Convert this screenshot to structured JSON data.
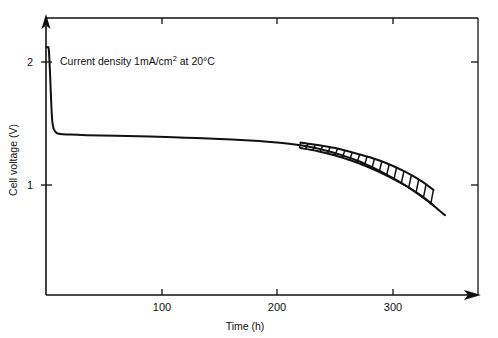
{
  "chart_data": {
    "type": "line",
    "title": "",
    "xlabel": "Time (h)",
    "ylabel": "Cell voltage (V)",
    "xlim": [
      0,
      360
    ],
    "ylim": [
      0,
      2.4
    ],
    "xticks": [
      100,
      200,
      300
    ],
    "xticklabels": [
      "100",
      "200",
      "300"
    ],
    "yticks": [
      1,
      2
    ],
    "yticklabels": [
      "1",
      "2"
    ],
    "grid": false,
    "legend": "none",
    "annotations": [
      {
        "name": "current-density-note",
        "text_prefix": "Current density 1mA/cm",
        "text_superscript": "2",
        "text_suffix": " at 20°C",
        "full_text": "Current density 1mA/cm2 at 20°C",
        "x": 20,
        "y": 2.05
      }
    ],
    "series": [
      {
        "name": "cell-voltage-discharge",
        "label": "Cell voltage",
        "x": [
          0,
          1,
          2,
          3,
          5,
          8,
          12,
          20,
          35,
          60,
          90,
          120,
          150,
          180,
          200,
          215,
          225,
          240,
          255,
          270,
          285,
          300,
          315,
          330,
          345
        ],
        "y": [
          2.12,
          2.12,
          2.1,
          1.92,
          1.52,
          1.43,
          1.415,
          1.41,
          1.405,
          1.4,
          1.395,
          1.385,
          1.375,
          1.36,
          1.345,
          1.33,
          1.315,
          1.285,
          1.245,
          1.195,
          1.13,
          1.055,
          0.97,
          0.87,
          0.755
        ]
      }
    ],
    "uncertainty_band": {
      "name": "tolerance-band",
      "style": "hatched",
      "x_start": 220,
      "x_end": 320,
      "upper_x": [
        220,
        235,
        250,
        265,
        280,
        295,
        310,
        325,
        335
      ],
      "upper_y": [
        1.345,
        1.325,
        1.3,
        1.265,
        1.225,
        1.175,
        1.11,
        1.03,
        0.96
      ],
      "lower_x": [
        220,
        235,
        250,
        265,
        280,
        295,
        310,
        325,
        335
      ],
      "lower_y": [
        1.3,
        1.275,
        1.24,
        1.195,
        1.14,
        1.075,
        1.0,
        0.91,
        0.835
      ],
      "hatch_count": 18
    }
  },
  "figure": {
    "background_color": "#ffffff",
    "line_color": "#111111",
    "frame": {
      "left": 46,
      "top": 18,
      "right": 478,
      "bottom": 295
    }
  }
}
